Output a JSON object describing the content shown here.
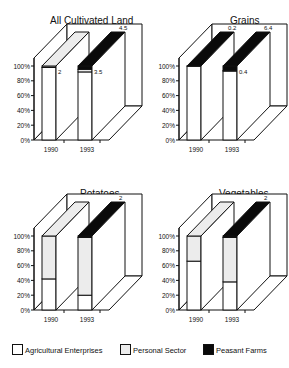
{
  "colors": {
    "agricultural_enterprises": "#ffffff",
    "personal_sector": "#ececec",
    "peasant_farms": "#0a0a0a",
    "outline": "#111111"
  },
  "legend": {
    "items": [
      {
        "label": "Agricultural Enterprises",
        "color": "#ffffff"
      },
      {
        "label": "Personal Sector",
        "color": "#ececec"
      },
      {
        "label": "Peasant Farms",
        "color": "#0a0a0a"
      }
    ]
  },
  "chart_data": [
    {
      "type": "bar",
      "stacked": true,
      "style": "3d-percent",
      "title": "All Cultivated Land",
      "categories": [
        "1990",
        "1993"
      ],
      "yticks": [
        "0%",
        "20%",
        "40%",
        "60%",
        "80%",
        "100%"
      ],
      "ylim": [
        0,
        100
      ],
      "series": [
        {
          "name": "Agricultural Enterprises",
          "values": [
            98,
            92
          ]
        },
        {
          "name": "Personal Sector",
          "values": [
            2,
            3.5
          ]
        },
        {
          "name": "Peasant Farms",
          "values": [
            0,
            4.5
          ]
        }
      ],
      "annotations": [
        {
          "bar": "1990",
          "text": "2",
          "segment": "Personal Sector"
        },
        {
          "bar": "1993",
          "text": "3.5",
          "segment": "Personal Sector"
        },
        {
          "bar": "1993",
          "text": "4.5",
          "segment": "Peasant Farms"
        }
      ]
    },
    {
      "type": "bar",
      "stacked": true,
      "style": "3d-percent",
      "title": "Grains",
      "categories": [
        "1990",
        "1993"
      ],
      "yticks": [
        "0%",
        "20%",
        "40%",
        "60%",
        "80%",
        "100%"
      ],
      "ylim": [
        0,
        100
      ],
      "series": [
        {
          "name": "Agricultural Enterprises",
          "values": [
            99.8,
            93.2
          ]
        },
        {
          "name": "Personal Sector",
          "values": [
            0,
            0.4
          ]
        },
        {
          "name": "Peasant Farms",
          "values": [
            0.2,
            6.4
          ]
        }
      ],
      "annotations": [
        {
          "bar": "1990",
          "text": "0.2",
          "segment": "Peasant Farms"
        },
        {
          "bar": "1993",
          "text": "0.4",
          "segment": "Personal Sector"
        },
        {
          "bar": "1993",
          "text": "6.4",
          "segment": "Peasant Farms"
        }
      ]
    },
    {
      "type": "bar",
      "stacked": true,
      "style": "3d-percent",
      "title": "Potatoes",
      "categories": [
        "1990",
        "1993"
      ],
      "yticks": [
        "0%",
        "20%",
        "40%",
        "60%",
        "80%",
        "100%"
      ],
      "ylim": [
        0,
        100
      ],
      "series": [
        {
          "name": "Agricultural Enterprises",
          "values": [
            42,
            20
          ]
        },
        {
          "name": "Personal Sector",
          "values": [
            58,
            78
          ]
        },
        {
          "name": "Peasant Farms",
          "values": [
            0,
            2
          ]
        }
      ],
      "annotations": [
        {
          "bar": "1993",
          "text": "2",
          "segment": "Peasant Farms"
        }
      ]
    },
    {
      "type": "bar",
      "stacked": true,
      "style": "3d-percent",
      "title": "Vegetables",
      "categories": [
        "1990",
        "1993"
      ],
      "yticks": [
        "0%",
        "20%",
        "40%",
        "60%",
        "80%",
        "100%"
      ],
      "ylim": [
        0,
        100
      ],
      "series": [
        {
          "name": "Agricultural Enterprises",
          "values": [
            66,
            38
          ]
        },
        {
          "name": "Personal Sector",
          "values": [
            34,
            60
          ]
        },
        {
          "name": "Peasant Farms",
          "values": [
            0,
            2
          ]
        }
      ],
      "annotations": [
        {
          "bar": "1993",
          "text": "2",
          "segment": "Peasant Farms"
        }
      ]
    }
  ]
}
